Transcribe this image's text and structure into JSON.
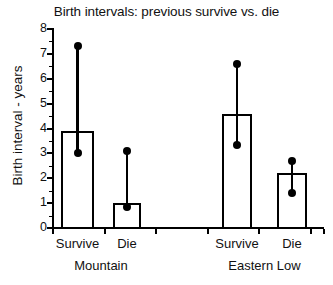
{
  "chart_data": {
    "type": "bar",
    "title": "Birth intervals: previous survive vs. die",
    "xlabel": "",
    "ylabel": "Birth interval - years",
    "ylim": [
      0,
      8
    ],
    "ytick_labels": [
      "0",
      "1",
      "2",
      "3",
      "4",
      "5",
      "6",
      "7",
      "8"
    ],
    "ytick_values": [
      0,
      1,
      2,
      3,
      4,
      5,
      6,
      7,
      8
    ],
    "minor_ticks": true,
    "grid": false,
    "legend": "none",
    "groups": [
      {
        "name": "Mountain",
        "categories": [
          "Survive",
          "Die"
        ]
      },
      {
        "name": "Eastern Low",
        "categories": [
          "Survive",
          "Die"
        ]
      }
    ],
    "categories": [
      "Survive",
      "Die",
      "Survive",
      "Die"
    ],
    "values": [
      3.9,
      1.0,
      4.6,
      2.2
    ],
    "error_high": [
      7.3,
      3.1,
      6.6,
      2.7
    ],
    "error_low": [
      3.0,
      0.85,
      3.35,
      1.4
    ],
    "bars": [
      {
        "group": "Mountain",
        "category": "Survive",
        "value": 3.9,
        "upper": 7.3,
        "lower": 3.0
      },
      {
        "group": "Mountain",
        "category": "Die",
        "value": 1.0,
        "upper": 3.1,
        "lower": 0.85
      },
      {
        "group": "Eastern Low",
        "category": "Survive",
        "value": 4.6,
        "upper": 6.6,
        "lower": 3.35
      },
      {
        "group": "Eastern Low",
        "category": "Die",
        "value": 2.2,
        "upper": 2.7,
        "lower": 1.4
      }
    ],
    "colors": {
      "bar_fill": "#ffffff",
      "bar_edge": "#000000",
      "marker": "#000000",
      "axis": "#000000"
    }
  }
}
